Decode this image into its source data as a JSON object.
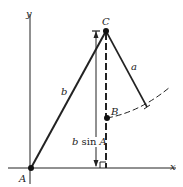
{
  "diagram": {
    "axes": {
      "x_label": "x",
      "y_label": "y"
    },
    "points": [
      {
        "name": "A",
        "label": "A"
      },
      {
        "name": "B",
        "label": "B"
      },
      {
        "name": "C",
        "label": "C"
      }
    ],
    "sides": {
      "a": "a",
      "b": "b"
    },
    "height_label": {
      "var": "b",
      "fn": "sin",
      "angle": "A"
    },
    "colors": {
      "stroke": "#222222",
      "background": "#ffffff"
    }
  }
}
